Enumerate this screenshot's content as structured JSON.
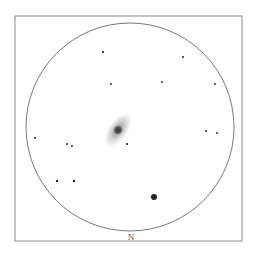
{
  "sketch": {
    "frame": {
      "x": 15,
      "y": 16,
      "width": 227,
      "height": 225,
      "stroke": "#8a8a8a"
    },
    "field_of_view": {
      "cx": 130,
      "cy": 127,
      "r": 104,
      "stroke": "#6a6a6a"
    },
    "orientation_label": {
      "text": "N",
      "x": 131,
      "y": 237
    },
    "galaxy": {
      "cx": 118,
      "cy": 130,
      "halo_rx": 10,
      "halo_ry": 20,
      "angle": 35,
      "core_r": 5,
      "color": "#555555"
    },
    "stars": [
      {
        "x": 103,
        "y": 52,
        "r": 1.1
      },
      {
        "x": 183,
        "y": 57,
        "r": 1.0
      },
      {
        "x": 111,
        "y": 84,
        "r": 0.9
      },
      {
        "x": 162,
        "y": 82,
        "r": 0.9
      },
      {
        "x": 215,
        "y": 84,
        "r": 0.9
      },
      {
        "x": 35,
        "y": 138,
        "r": 1.0
      },
      {
        "x": 67,
        "y": 144,
        "r": 1.0
      },
      {
        "x": 72,
        "y": 146,
        "r": 0.9
      },
      {
        "x": 127,
        "y": 144,
        "r": 1.1
      },
      {
        "x": 206,
        "y": 131,
        "r": 1.0
      },
      {
        "x": 217,
        "y": 133,
        "r": 0.9
      },
      {
        "x": 57,
        "y": 181,
        "r": 1.2
      },
      {
        "x": 74,
        "y": 181,
        "r": 1.2
      },
      {
        "x": 154,
        "y": 197,
        "r": 3.0
      }
    ]
  }
}
